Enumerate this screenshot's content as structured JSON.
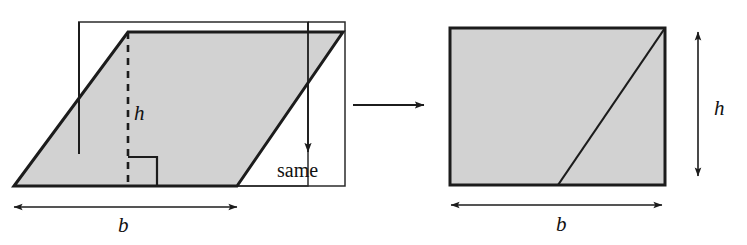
{
  "figure": {
    "colors": {
      "fill": "#d2d2d2",
      "stroke": "#1c1c1c",
      "thin_stroke": "#2b2b2b",
      "background": "#ffffff"
    },
    "left_panel": {
      "name": "parallelogram-panel",
      "shape": "parallelogram",
      "vertices": [
        [
          14,
          186
        ],
        [
          128,
          32
        ],
        [
          343,
          32
        ],
        [
          237,
          186
        ]
      ],
      "bounding_rectangle": [
        [
          78,
          22
        ],
        [
          308,
          22
        ],
        [
          308,
          186
        ],
        [
          78,
          186
        ]
      ],
      "height_dashed_line": {
        "x": 128,
        "y_top": 32,
        "y_bottom": 186
      },
      "right_angle_marker": {
        "x": 128,
        "y": 157,
        "size": 29
      },
      "cut_line": {
        "x": 79,
        "y_top": 22,
        "y_bottom": 154
      },
      "same_arrow": {
        "x": 308,
        "y_top": 22,
        "y_bottom": 155
      },
      "labels": {
        "height": "h",
        "base": "b",
        "same": "same"
      },
      "base_dimension": {
        "x1": 14,
        "x2": 237,
        "y": 207
      }
    },
    "transform_arrow": {
      "name": "transform-arrow",
      "x1": 353,
      "x2": 427,
      "y": 105
    },
    "right_panel": {
      "name": "rectangle-panel",
      "shape": "rectangle",
      "rect": [
        [
          450,
          28
        ],
        [
          665,
          28
        ],
        [
          665,
          185
        ],
        [
          450,
          185
        ]
      ],
      "diagonal": {
        "x1": 558,
        "y1": 185,
        "x2": 665,
        "y2": 28
      },
      "labels": {
        "height": "h",
        "base": "b"
      },
      "height_dimension": {
        "x": 698,
        "y1": 30,
        "y2": 178
      },
      "base_dimension": {
        "x1": 451,
        "x2": 662,
        "y": 205
      }
    }
  }
}
